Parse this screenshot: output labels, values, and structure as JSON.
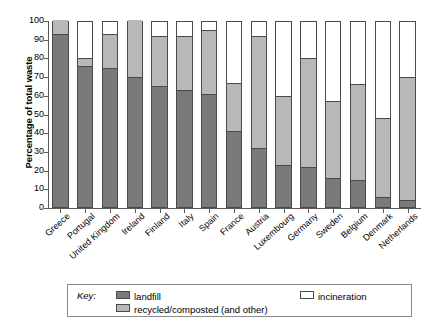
{
  "chart_data": {
    "type": "bar",
    "subtype": "stacked-bar-100",
    "title": "",
    "xlabel": "",
    "ylabel": "Percentage of total waste",
    "ylim": [
      0,
      100
    ],
    "y_ticks": [
      0,
      10,
      20,
      30,
      40,
      50,
      60,
      70,
      80,
      90,
      100
    ],
    "grid": false,
    "legend_position": "bottom",
    "categories": [
      "Greece",
      "Portugal",
      "United Kingdom",
      "Ireland",
      "Finland",
      "Italy",
      "Spain",
      "France",
      "Austria",
      "Luxembourg",
      "Germany",
      "Sweden",
      "Belgium",
      "Denmark",
      "Netherlands"
    ],
    "series": [
      {
        "name": "landfill",
        "color": "#7a7a7a",
        "values": [
          92,
          75,
          74,
          69,
          64,
          62,
          60,
          40,
          31,
          22,
          21,
          15,
          14,
          5,
          3
        ]
      },
      {
        "name": "recycled/composted (and other)",
        "color": "#b8b8b8",
        "values": [
          8,
          4,
          18,
          31,
          27,
          29,
          34,
          26,
          60,
          37,
          58,
          41,
          51,
          42,
          66
        ]
      },
      {
        "name": "incineration",
        "color": "#ffffff",
        "values": [
          0,
          21,
          8,
          0,
          9,
          9,
          6,
          34,
          9,
          41,
          21,
          44,
          35,
          53,
          31
        ]
      }
    ],
    "cumulative_tops": {
      "landfill": [
        92,
        75,
        74,
        69,
        64,
        62,
        60,
        40,
        31,
        22,
        21,
        15,
        14,
        5,
        3
      ],
      "recycled": [
        100,
        79,
        92,
        100,
        91,
        91,
        94,
        66,
        91,
        59,
        79,
        56,
        65,
        47,
        69
      ],
      "incineration": [
        100,
        100,
        100,
        100,
        100,
        100,
        100,
        100,
        100,
        100,
        100,
        100,
        100,
        100,
        100
      ]
    }
  },
  "axis": {
    "y_title": "Percentage of total waste",
    "y_tick_labels": [
      "100",
      "90",
      "80",
      "70",
      "60",
      "50",
      "40",
      "30",
      "20",
      "10",
      "0"
    ]
  },
  "legend": {
    "key_word": "Key:",
    "entries": [
      {
        "label": "landfill",
        "swatch": "landfill-swatch"
      },
      {
        "label": "recycled/composted (and other)",
        "swatch": "recycled-swatch"
      },
      {
        "label": "incineration",
        "swatch": "incineration-swatch"
      }
    ]
  },
  "colors": {
    "landfill": "#7a7a7a",
    "recycled": "#b8b8b8",
    "incineration": "#ffffff",
    "axis": "#5a5a5a",
    "bar_outline": "#4a4a4a",
    "legend_border": "#8a8a8a"
  }
}
